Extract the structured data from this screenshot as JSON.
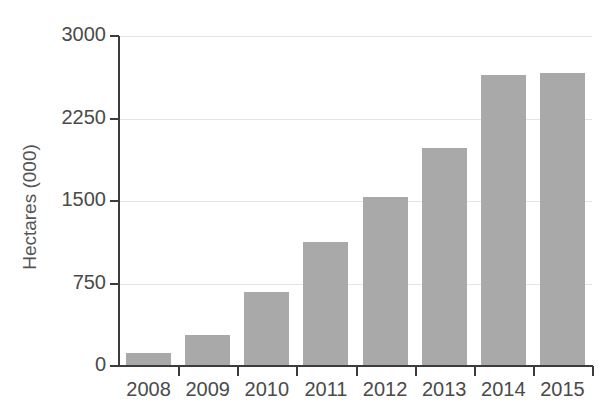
{
  "chart_data": {
    "type": "bar",
    "title": "",
    "subtitle": "",
    "xlabel": "",
    "ylabel": "Hectares (000)",
    "categories": [
      "2008",
      "2009",
      "2010",
      "2011",
      "2012",
      "2013",
      "2014",
      "2015"
    ],
    "values": [
      120,
      285,
      675,
      1130,
      1535,
      1985,
      2650,
      2665
    ],
    "series": [
      {
        "name": "Hectares (000)",
        "values": [
          120,
          285,
          675,
          1130,
          1535,
          1985,
          2650,
          2665
        ]
      }
    ],
    "ylim": [
      0,
      3000
    ],
    "ytick_labels": [
      "0",
      "750",
      "1500",
      "2250",
      "3000"
    ],
    "ytick_values": [
      0,
      750,
      1500,
      2250,
      3000
    ],
    "grid": true,
    "grid_axis": "y",
    "legend": false,
    "legend_position": "none",
    "bar_color": "#a9a9a9",
    "gridline_color": "#e4e4e4",
    "axis_color": "#3c3c3c",
    "text_color": "#4a4a4a",
    "background_color": "#ffffff",
    "annotations": []
  }
}
